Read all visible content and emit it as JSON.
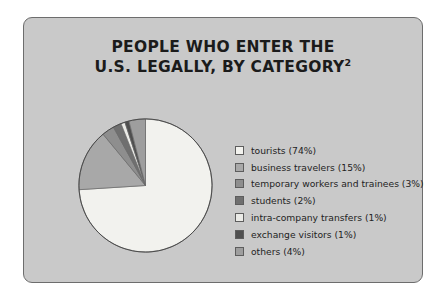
{
  "figure": {
    "panel_bg": "#c9c9c9",
    "panel_border": "#6d6d6d",
    "page_bg": "#ffffff"
  },
  "title": {
    "line1": "PEOPLE WHO ENTER THE",
    "line2": "U.S. LEGALLY, BY CATEGORY",
    "superscript": "2"
  },
  "chart_data": {
    "type": "pie",
    "title": "PEOPLE WHO ENTER THE U.S. LEGALLY, BY CATEGORY",
    "xlabel": "",
    "ylabel": "",
    "legend_position": "right",
    "grid": false,
    "start_angle_deg": 0,
    "direction": "clockwise",
    "categories": [
      "tourists",
      "business travelers",
      "temporary workers and trainees",
      "students",
      "intra-company transfers",
      "exchange visitors",
      "others"
    ],
    "values": [
      74,
      15,
      3,
      2,
      1,
      1,
      4
    ],
    "units": "percent",
    "colors": [
      "#f2f2ee",
      "#a8a8a8",
      "#8e8e8e",
      "#6f6f6f",
      "#ebebe7",
      "#4f4f4f",
      "#9e9e9e"
    ],
    "labels": [
      "tourists (74%)",
      "business travelers (15%)",
      "temporary workers and trainees (3%)",
      "students (2%)",
      "intra-company transfers (1%)",
      "exchange visitors (1%)",
      "others (4%)"
    ]
  },
  "legend": {
    "items": [
      {
        "label": "tourists (74%)",
        "color": "#f2f2ee",
        "name": "tourists"
      },
      {
        "label": "business travelers (15%)",
        "color": "#a8a8a8",
        "name": "business-travelers"
      },
      {
        "label": "temporary workers and trainees (3%)",
        "color": "#8e8e8e",
        "name": "temporary-workers-and-trainees"
      },
      {
        "label": "students (2%)",
        "color": "#6f6f6f",
        "name": "students"
      },
      {
        "label": "intra-company transfers (1%)",
        "color": "#ebebe7",
        "name": "intra-company-transfers"
      },
      {
        "label": "exchange visitors (1%)",
        "color": "#4f4f4f",
        "name": "exchange-visitors"
      },
      {
        "label": "others (4%)",
        "color": "#9e9e9e",
        "name": "others"
      }
    ]
  }
}
